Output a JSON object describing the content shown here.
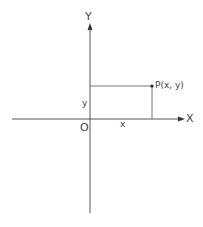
{
  "diagram": {
    "colors": {
      "axis": "#555555",
      "guide": "#777777",
      "text": "#444444",
      "point": "#222222"
    },
    "labels": {
      "y_axis": "Y",
      "x_axis": "X",
      "origin": "O",
      "x_coord": "x",
      "y_coord": "y",
      "point": "P(x, y)"
    },
    "geometry": {
      "origin": [
        90,
        119
      ],
      "x_axis_range": [
        12,
        184
      ],
      "y_axis_range": [
        24,
        213
      ],
      "point_p": [
        152,
        86
      ]
    }
  }
}
